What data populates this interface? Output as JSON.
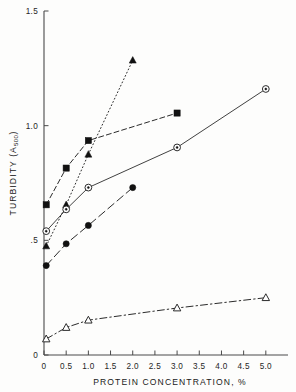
{
  "chart_data": {
    "type": "line",
    "title": "",
    "xlabel": "PROTEIN CONCENTRATION, %",
    "ylabel": "TURBIDITY (A500)",
    "ylabel_main": "TURBIDITY  (A",
    "ylabel_sub": "500",
    "ylabel_tail": ")",
    "xlim": [
      0,
      5.5
    ],
    "ylim": [
      0,
      1.5
    ],
    "grid": false,
    "legend": "none",
    "xticks": [
      0,
      0.5,
      1.0,
      1.5,
      2.0,
      2.5,
      3.0,
      3.5,
      4.0,
      4.5,
      5.0
    ],
    "xticklabels": [
      "0",
      "0.5",
      "1.0",
      "1.5",
      "2.0",
      "2.5",
      "3.0",
      "3.5",
      "4.0",
      "4.5",
      "5.0"
    ],
    "yticks": [
      0,
      0.5,
      1.0,
      1.5
    ],
    "yticklabels": [
      "0",
      ".5",
      "1.0",
      "1.5"
    ],
    "series": [
      {
        "name": "filled-triangle-dotted",
        "marker": "triangle-filled",
        "linestyle": "dotted",
        "x": [
          0.05,
          0.5,
          1.0,
          2.0
        ],
        "y": [
          0.475,
          0.655,
          0.875,
          1.285
        ]
      },
      {
        "name": "filled-square-dashed",
        "marker": "square-filled",
        "linestyle": "dashed",
        "x": [
          0.05,
          0.5,
          1.0,
          3.0
        ],
        "y": [
          0.655,
          0.815,
          0.935,
          1.055
        ]
      },
      {
        "name": "open-circle-solid",
        "marker": "circle-open",
        "linestyle": "solid",
        "x": [
          0.05,
          0.5,
          1.0,
          3.0,
          5.0
        ],
        "y": [
          0.54,
          0.635,
          0.73,
          0.905,
          1.16
        ]
      },
      {
        "name": "filled-circle-longdash",
        "marker": "circle-filled",
        "linestyle": "long-dash",
        "x": [
          0.05,
          0.5,
          1.0,
          2.0
        ],
        "y": [
          0.39,
          0.485,
          0.565,
          0.73
        ]
      },
      {
        "name": "open-triangle-dashdot",
        "marker": "triangle-open",
        "linestyle": "dash-dot",
        "x": [
          0.05,
          0.5,
          1.0,
          3.0,
          5.0
        ],
        "y": [
          0.07,
          0.12,
          0.152,
          0.205,
          0.25
        ]
      }
    ]
  },
  "axes": {
    "x_title": "PROTEIN CONCENTRATION, %",
    "y_title_main": "TURBIDITY  (A",
    "y_title_sub": "500",
    "y_title_tail": ")"
  },
  "colors": {
    "ink": "#2b2b2b",
    "marker_fill": "#111111",
    "marker_open": "#ffffff",
    "background": "#fdfdfc"
  }
}
